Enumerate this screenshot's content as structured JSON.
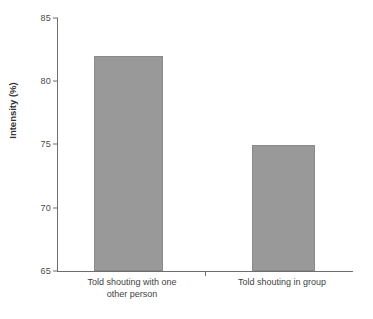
{
  "chart_data": {
    "type": "bar",
    "title": "",
    "subtitle": "",
    "xlabel": "",
    "ylabel": "Intensity (%)",
    "categories": [
      "Told shouting with one other person",
      "Told shouting in group"
    ],
    "category_lines": [
      [
        "Told shouting with one",
        "other person"
      ],
      [
        "Told shouting in group"
      ]
    ],
    "values": [
      82,
      75
    ],
    "ylim": [
      65,
      85
    ],
    "yticks": [
      65,
      70,
      75,
      80,
      85
    ],
    "ytick_labels": [
      "65",
      "70",
      "75",
      "80",
      "85"
    ],
    "grid": false,
    "legend": null,
    "legend_position": "none",
    "bar_color": "#999999",
    "bar_edge_color": "#8a8a8a",
    "axis_color": "#6e6e6e",
    "background": "#ffffff",
    "annotations": []
  },
  "footer": {
    "caption": ""
  }
}
